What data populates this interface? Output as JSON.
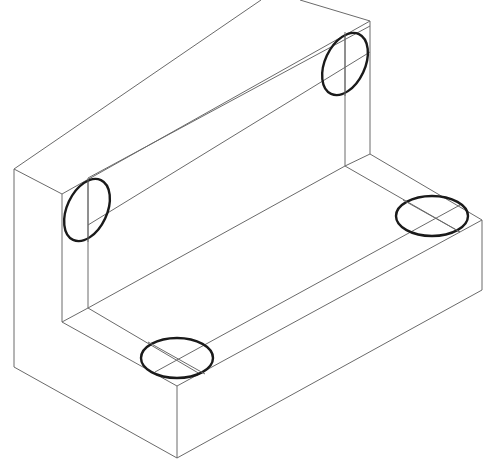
{
  "diagram": {
    "type": "isometric-drawing",
    "colors": {
      "background": "#ffffff",
      "edge": "#6a6a6a",
      "hole": "#1a1a1a"
    },
    "holes": [
      {
        "name": "upright-left-hole",
        "cx": 87,
        "cy": 210,
        "rx": 21,
        "ry": 34,
        "rotate": 30
      },
      {
        "name": "upright-right-hole",
        "cx": 345,
        "cy": 64,
        "rx": 21,
        "ry": 34,
        "rotate": 30
      },
      {
        "name": "base-front-hole",
        "cx": 177,
        "cy": 358,
        "rx": 35,
        "ry": 20,
        "rotate": 0
      },
      {
        "name": "base-right-hole",
        "cx": 432,
        "cy": 216,
        "rx": 35,
        "ry": 20,
        "rotate": 0
      }
    ]
  }
}
